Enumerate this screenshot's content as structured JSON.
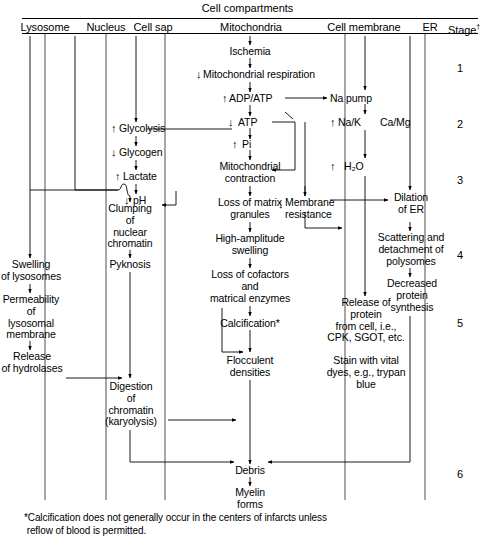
{
  "figure": {
    "title": "Cell compartments",
    "stage_header": "Stage",
    "stage_header_marker": "†",
    "footnote": "*Calcification does not generally occur in the centers of infarcts unless\n reflow of blood is permitted."
  },
  "columns": [
    {
      "id": "lysosome",
      "label": "Lysosome"
    },
    {
      "id": "nucleus",
      "label": "Nucleus"
    },
    {
      "id": "cell-sap",
      "label": "Cell sap"
    },
    {
      "id": "mitochondria",
      "label": "Mitochondria"
    },
    {
      "id": "cell-membrane",
      "label": "Cell membrane"
    },
    {
      "id": "er",
      "label": "ER"
    },
    {
      "id": "stage",
      "label": "Stage"
    }
  ],
  "stages": [
    "1",
    "2",
    "3",
    "4",
    "5",
    "6"
  ],
  "nodes": {
    "ischemia": "Ischemia",
    "mito_respiration": "Mitochondrial respiration",
    "mito_respiration_arrow": "↓",
    "adp_atp": "ADP/ATP",
    "adp_atp_arrow": "↑",
    "na_pump": "Na pump",
    "atp": "ATP",
    "atp_arrow": "↓",
    "pi": "Pi",
    "pi_arrow": "↑",
    "glycolysis": "Glycolysis",
    "glycolysis_arrow": "↑",
    "glycogen": "Glycogen",
    "glycogen_arrow": "↓",
    "lactate": "Lactate",
    "lactate_arrow": "↑",
    "ph": "pH",
    "ph_arrow": "↓",
    "na_k": "Na/K",
    "na_k_arrow": "↑",
    "ca_mg": "Ca/Mg",
    "h2o": "H₂O",
    "h2o_arrow": "↑",
    "mito_contraction": "Mitochondrial\ncontraction",
    "loss_matrix_granules": "Loss of matrix\ngranules",
    "membrane_resistance": "Membrane\nresistance",
    "membrane_resistance_arrow": "↓",
    "clumping": "Clumping\nof\nnuclear\nchromatin",
    "pyknosis": "Pyknosis",
    "high_amplitude_swelling": "High-amplitude\nswelling",
    "loss_cofactors": "Loss of cofactors\nand\nmatrical enzymes",
    "calcification": "Calcification*",
    "flocculent": "Flocculent\ndensities",
    "swelling_lysosomes": "Swelling\nof lysosomes",
    "permeability": "Permeability\nof\nlysosomal\nmembrane",
    "release_hydrolases": "Release\nof hydrolases",
    "digestion": "Digestion\nof\nchromatin\n(karyolysis)",
    "dilation_er": "Dilation\nof ER",
    "scattering": "Scattering and\ndetachment of\npolysomes",
    "decreased_protein": "Decreased\nprotein\nsynthesis",
    "release_protein": "Release of\nprotein\nfrom cell, i.e.,\nCPK, SGOT, etc.",
    "stain_vital": "Stain with vital\ndyes, e.g., trypan\nblue",
    "debris": "Debris",
    "myelin": "Myelin\nforms"
  },
  "colors": {
    "ink": "#000000",
    "background": "#ffffff"
  }
}
